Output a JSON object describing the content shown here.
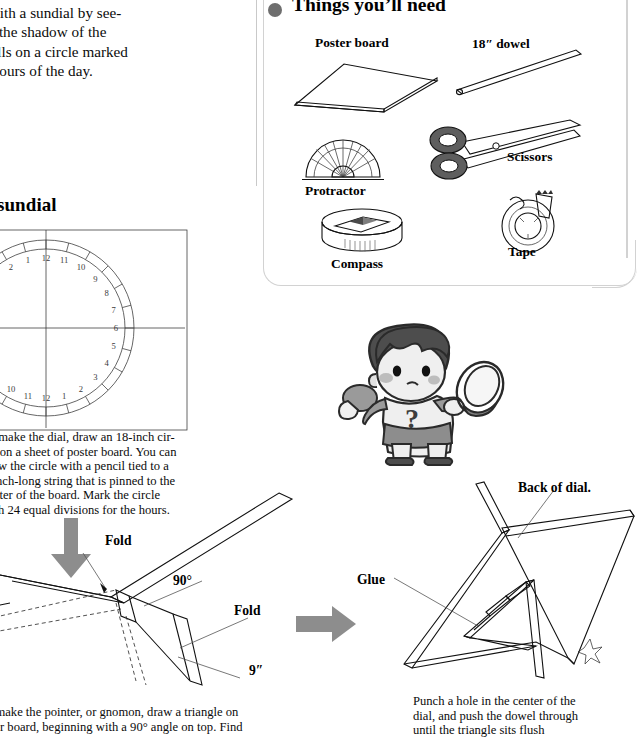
{
  "article": {
    "intro_paragraph": "ce ancient times. You can still\ntime with a sundial by see-\nwhere the shadow of the\nnter falls on a circle marked\nh the hours of the day.",
    "section_heading": "g a sundial",
    "dial_caption": "To make the dial, draw an 18-inch cir-\ncle on a sheet of poster board. You can\ndraw the circle with a pencil tied to a\n9-inch-long string that is pinned to the\ncenter of the board. Mark the circle\nwith 24 equal divisions for the hours.",
    "gnomon_caption": "o make the pointer, or gnomon, draw a triangle on\nster board, beginning with a 90° angle on top. Find",
    "final_caption": "Punch a hole in the center of the\ndial, and push the dowel through\nuntil the triangle sits flush"
  },
  "things_panel": {
    "title": "Things you’ll need",
    "bullet_icon": "filled-circle-bullet",
    "items": [
      {
        "label": "Poster board",
        "icon": "poster-board-icon"
      },
      {
        "label": "18″ dowel",
        "icon": "dowel-icon"
      },
      {
        "label": "Scissors",
        "icon": "scissors-icon"
      },
      {
        "label": "Protractor",
        "icon": "protractor-icon"
      },
      {
        "label": "Compass",
        "icon": "compass-icon"
      },
      {
        "label": "Tape",
        "icon": "tape-icon"
      }
    ]
  },
  "dial_diagram": {
    "name": "sundial-dial-face",
    "outer_hours": [
      "12",
      "11",
      "10",
      "9",
      "8",
      "7",
      "6",
      "5",
      "4",
      "3",
      "2",
      "1",
      "12",
      "11",
      "10",
      "9",
      "8",
      "7",
      "6",
      "5",
      "4",
      "3",
      "2",
      "1"
    ],
    "divisions": 24,
    "top_label": "12",
    "bottom_label": "12",
    "left_label": "6",
    "right_label": "6"
  },
  "fold_diagram": {
    "labels": [
      {
        "text": "Fold",
        "name": "fold-label-top"
      },
      {
        "text": "90°",
        "name": "angle-label"
      },
      {
        "text": "Fold",
        "name": "fold-label-right"
      },
      {
        "text": "9″",
        "name": "length-label"
      }
    ],
    "arrow_down": "down-arrow-icon",
    "arrow_right": "right-arrow-icon"
  },
  "assembly_diagram": {
    "labels": [
      {
        "text": "Back of dial.",
        "name": "back-of-dial-label"
      },
      {
        "text": "Glue",
        "name": "glue-label"
      }
    ]
  },
  "illustration": {
    "character": "boy-with-magnifying-glass",
    "shirt_symbol": "?"
  },
  "colors": {
    "ink": "#111111",
    "arrow_gray": "#8d8d8d",
    "panel_border": "#d2d2d2",
    "hair_dark": "#4a4a4a",
    "skin_light": "#e7e7e7"
  }
}
